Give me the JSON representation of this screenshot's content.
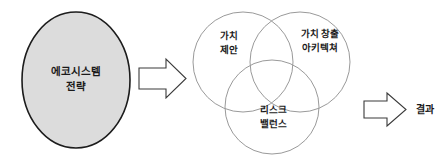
{
  "diagram": {
    "title_text": "",
    "colors": {
      "main_circle_fill": "#dcdcdc",
      "main_circle_stroke": "#1c1c1c",
      "venn_circle_stroke": "#9a9a9a",
      "arrow_fill": "#ffffff",
      "arrow_stroke": "#3a3a3a",
      "text_color": "#1a1a1a",
      "background": "#ffffff"
    },
    "source_node": {
      "label_line1": "에코시스템",
      "label_line2": "전략"
    },
    "arrow_1": {
      "label": "",
      "direction": "right"
    },
    "venn": {
      "circles": [
        {
          "id": "value-proposition",
          "label_line1": "가치",
          "label_line2": "제안"
        },
        {
          "id": "value-creation-architecture",
          "label_line1": "가치 창출",
          "label_line2": "아키텍쳐"
        },
        {
          "id": "risk-balance",
          "label_line1": "리스크",
          "label_line2": "밸런스"
        }
      ]
    },
    "arrow_2": {
      "label": "",
      "direction": "right"
    },
    "result_node": {
      "label": "결과"
    }
  }
}
